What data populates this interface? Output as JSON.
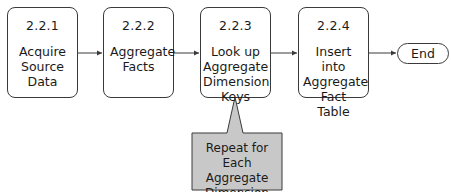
{
  "diagram": {
    "type": "process-flow",
    "steps": [
      {
        "id": "2.2.1",
        "label": "Acquire Source Data"
      },
      {
        "id": "2.2.2",
        "label": "Aggregate Facts"
      },
      {
        "id": "2.2.3",
        "label": "Look up Aggregate Dimension Keys"
      },
      {
        "id": "2.2.4",
        "label": "Insert into Aggregate Fact Table"
      }
    ],
    "terminal": {
      "label": "End"
    },
    "callout": {
      "label": "Repeat for Each Aggregate Dimension",
      "attached_to": "2.2.3",
      "fill": "#c8c8c8"
    },
    "edges": [
      {
        "from": "2.2.1",
        "to": "2.2.2"
      },
      {
        "from": "2.2.2",
        "to": "2.2.3"
      },
      {
        "from": "2.2.3",
        "to": "2.2.4"
      },
      {
        "from": "2.2.4",
        "to": "End"
      }
    ]
  }
}
